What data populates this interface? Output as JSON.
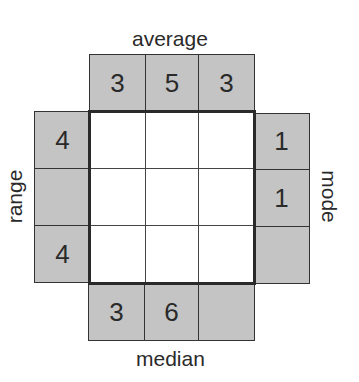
{
  "puzzle": {
    "labels": {
      "top": "average",
      "left": "range",
      "right": "mode",
      "bottom": "median"
    },
    "clues": {
      "top": [
        "3",
        "5",
        "3"
      ],
      "left": [
        "4",
        "",
        "4"
      ],
      "right": [
        "1",
        "1",
        ""
      ],
      "bottom": [
        "3",
        "6",
        ""
      ]
    },
    "grid": [
      [
        "",
        "",
        ""
      ],
      [
        "",
        "",
        ""
      ],
      [
        "",
        "",
        ""
      ]
    ],
    "colors": {
      "clue_bg": "#c4c4c4",
      "cell_bg": "#ffffff",
      "border": "#2a2a2a"
    }
  }
}
